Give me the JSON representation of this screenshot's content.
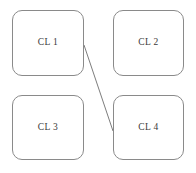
{
  "diagram": {
    "title": "",
    "background_color": "#ffffff",
    "node_border_color": "#8a8a8a",
    "node_fill_color": "#ffffff",
    "edge_color": "#7d7d7d",
    "label_color": "#3a3a3a",
    "nodes": [
      {
        "id": "cl1",
        "label": "CL 1"
      },
      {
        "id": "cl2",
        "label": "CL 2"
      },
      {
        "id": "cl3",
        "label": "CL 3"
      },
      {
        "id": "cl4",
        "label": "CL 4"
      }
    ],
    "edges": [
      {
        "id": "cl1-cl4",
        "from": "CL 1",
        "to": "CL 4",
        "label": ""
      }
    ]
  }
}
